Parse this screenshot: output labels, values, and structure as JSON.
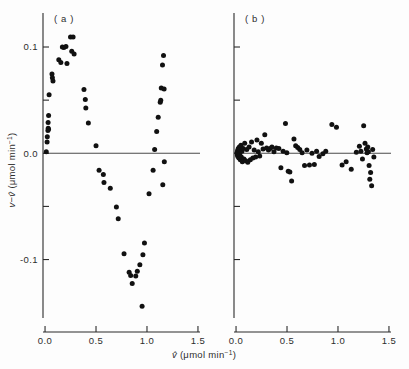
{
  "figure": {
    "axis_color": "#2b2b2b",
    "point_color": "#111111",
    "zero_line_color": "#4a4a4a",
    "background": "#fdfdfd",
    "y_axis_title_parts": {
      "v": "v",
      "minus": "−",
      "vhat": "v̂",
      "units": " (μmol min",
      "exp": "−1",
      "close": ")"
    },
    "x_axis_title_parts": {
      "vhat": "v̂",
      "units": " (μmol min",
      "exp": "−1",
      "close": ")"
    },
    "y_axis_title_full": "v−v̂ (μmol min⁻¹)",
    "x_axis_title_full": "v̂ (μmol min⁻¹)",
    "x_tick_labels": [
      "0.0",
      "0.5",
      "1.0",
      "1.5"
    ],
    "x_tick_values": [
      0.0,
      0.5,
      1.0,
      1.5
    ],
    "y_tick_labels": [
      "0.1",
      "0.0",
      "-0.1"
    ],
    "y_tick_values": [
      0.1,
      0.0,
      -0.1
    ],
    "y_minor_tick_values": [
      0.05,
      -0.05
    ]
  },
  "chart_data": [
    {
      "type": "scatter",
      "panel_label": "( a )",
      "title": "",
      "xlabel": "v̂ (μmol min⁻¹)",
      "ylabel": "v−v̂ (μmol min⁻¹)",
      "xlim": [
        -0.02,
        1.52
      ],
      "ylim": [
        -0.155,
        0.132
      ],
      "grid": false,
      "legend": "none",
      "reference_line_y": 0.0,
      "points": [
        [
          0.012,
          0.0015
        ],
        [
          0.02,
          0.0105
        ],
        [
          0.022,
          0.0155
        ],
        [
          0.028,
          0.0215
        ],
        [
          0.031,
          0.0235
        ],
        [
          0.034,
          0.0225
        ],
        [
          0.03,
          0.029
        ],
        [
          0.035,
          0.0355
        ],
        [
          0.04,
          0.055
        ],
        [
          0.068,
          0.0745
        ],
        [
          0.072,
          0.071
        ],
        [
          0.078,
          0.068
        ],
        [
          0.135,
          0.088
        ],
        [
          0.155,
          0.0855
        ],
        [
          0.17,
          0.1
        ],
        [
          0.185,
          0.0995
        ],
        [
          0.205,
          0.1005
        ],
        [
          0.215,
          0.0845
        ],
        [
          0.25,
          0.1095
        ],
        [
          0.262,
          0.096
        ],
        [
          0.275,
          0.1095
        ],
        [
          0.285,
          0.0935
        ],
        [
          0.382,
          0.06
        ],
        [
          0.395,
          0.0505
        ],
        [
          0.4,
          0.0425
        ],
        [
          0.425,
          0.0285
        ],
        [
          0.5,
          0.007
        ],
        [
          0.53,
          -0.016
        ],
        [
          0.572,
          -0.02
        ],
        [
          0.578,
          -0.0275
        ],
        [
          0.64,
          -0.033
        ],
        [
          0.7,
          -0.0505
        ],
        [
          0.718,
          -0.0615
        ],
        [
          0.775,
          -0.0945
        ],
        [
          0.825,
          -0.112
        ],
        [
          0.84,
          -0.115
        ],
        [
          0.855,
          -0.1225
        ],
        [
          0.89,
          -0.1155
        ],
        [
          0.905,
          -0.111
        ],
        [
          0.93,
          -0.105
        ],
        [
          0.952,
          -0.144
        ],
        [
          0.96,
          -0.0955
        ],
        [
          0.975,
          -0.0845
        ],
        [
          1.02,
          -0.038
        ],
        [
          1.06,
          -0.016
        ],
        [
          1.075,
          0.0035
        ],
        [
          1.095,
          0.0205
        ],
        [
          1.11,
          0.034
        ],
        [
          1.13,
          0.048
        ],
        [
          1.135,
          0.05
        ],
        [
          1.14,
          0.0615
        ],
        [
          1.168,
          0.0605
        ],
        [
          1.152,
          0.083
        ],
        [
          1.162,
          0.092
        ],
        [
          1.17,
          -0.008
        ],
        [
          1.155,
          -0.0295
        ]
      ]
    },
    {
      "type": "scatter",
      "panel_label": "( b )",
      "title": "",
      "xlabel": "v̂ (μmol min⁻¹)",
      "ylabel": "v−v̂ (μmol min⁻¹)",
      "xlim": [
        -0.02,
        1.52
      ],
      "ylim": [
        -0.155,
        0.132
      ],
      "grid": false,
      "legend": "none",
      "reference_line_y": 0.0,
      "points": [
        [
          0.01,
          0.0005
        ],
        [
          0.012,
          -0.0015
        ],
        [
          0.015,
          0.0025
        ],
        [
          0.018,
          -0.003
        ],
        [
          0.022,
          0.0045
        ],
        [
          0.024,
          0.001
        ],
        [
          0.028,
          -0.0045
        ],
        [
          0.032,
          0.006
        ],
        [
          0.035,
          -0.001
        ],
        [
          0.038,
          0.0035
        ],
        [
          0.042,
          -0.006
        ],
        [
          0.048,
          0.0075
        ],
        [
          0.052,
          -0.0035
        ],
        [
          0.058,
          0.002
        ],
        [
          0.062,
          -0.008
        ],
        [
          0.07,
          0.0045
        ],
        [
          0.078,
          -0.0055
        ],
        [
          0.085,
          0.0095
        ],
        [
          0.095,
          -0.007
        ],
        [
          0.105,
          0.0035
        ],
        [
          0.115,
          -0.0085
        ],
        [
          0.128,
          0.006
        ],
        [
          0.14,
          -0.006
        ],
        [
          0.152,
          0.0105
        ],
        [
          0.165,
          -0.0045
        ],
        [
          0.178,
          0.003
        ],
        [
          0.192,
          -0.0035
        ],
        [
          0.205,
          0.0125
        ],
        [
          0.218,
          0.0015
        ],
        [
          0.232,
          -0.0025
        ],
        [
          0.248,
          0.0095
        ],
        [
          0.265,
          0.004
        ],
        [
          0.282,
          0.0175
        ],
        [
          0.3,
          0.005
        ],
        [
          0.318,
          0.003
        ],
        [
          0.335,
          0.0045
        ],
        [
          0.352,
          0.006
        ],
        [
          0.372,
          0.0015
        ],
        [
          0.395,
          0.005
        ],
        [
          0.42,
          0.0045
        ],
        [
          0.44,
          -0.0135
        ],
        [
          0.462,
          0.002
        ],
        [
          0.485,
          0.028
        ],
        [
          0.498,
          0.0005
        ],
        [
          0.512,
          -0.017
        ],
        [
          0.528,
          -0.0175
        ],
        [
          0.545,
          -0.026
        ],
        [
          0.568,
          0.0135
        ],
        [
          0.585,
          0.007
        ],
        [
          0.605,
          0.0055
        ],
        [
          0.625,
          0.0035
        ],
        [
          0.648,
          0.0005
        ],
        [
          0.672,
          -0.0115
        ],
        [
          0.695,
          0.003
        ],
        [
          0.72,
          -0.011
        ],
        [
          0.745,
          0.0
        ],
        [
          0.768,
          -0.0105
        ],
        [
          0.79,
          0.002
        ],
        [
          0.815,
          -0.003
        ],
        [
          0.852,
          -0.0005
        ],
        [
          0.88,
          0.002
        ],
        [
          0.94,
          0.027
        ],
        [
          0.985,
          0.0245
        ],
        [
          1.04,
          -0.011
        ],
        [
          1.08,
          -0.008
        ],
        [
          1.13,
          -0.015
        ],
        [
          1.18,
          0.001
        ],
        [
          1.21,
          0.0065
        ],
        [
          1.225,
          0.002
        ],
        [
          1.24,
          -0.0055
        ],
        [
          1.252,
          0.026
        ],
        [
          1.265,
          0.0095
        ],
        [
          1.278,
          0.004
        ],
        [
          1.285,
          0.0005
        ],
        [
          1.292,
          0.006
        ],
        [
          1.298,
          0.0015
        ],
        [
          1.305,
          -0.0115
        ],
        [
          1.312,
          -0.0245
        ],
        [
          1.32,
          -0.018
        ],
        [
          1.33,
          -0.0305
        ],
        [
          1.34,
          0.0035
        ],
        [
          1.352,
          -0.0035
        ]
      ]
    }
  ]
}
